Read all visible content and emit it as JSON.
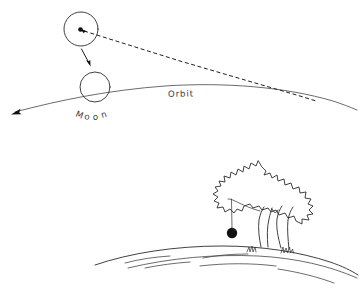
{
  "figure": {
    "background_color": "#ffffff",
    "ink_color": "#1a1a1a",
    "width": 361,
    "height": 295
  },
  "labels": {
    "orbit": "Orbit",
    "moon": "Moon",
    "moon_letters": [
      "M",
      "o",
      "o",
      "n"
    ]
  },
  "objects": {
    "upper_body": {
      "name": "moon-displaced-position",
      "center_x": 81,
      "center_y": 29,
      "radius": 17,
      "center_dot_radius": 2.2
    },
    "orbiting_body": {
      "name": "moon-on-orbit",
      "center_x": 95,
      "center_y": 87,
      "radius": 15
    },
    "apple": {
      "name": "falling-apple",
      "center_x": 232,
      "center_y": 233,
      "radius": 5.2,
      "string_top_y": 199
    }
  },
  "lines": {
    "orbit_arrow_tip": {
      "x": 13,
      "y": 113
    },
    "tangent_dashed": {
      "from_x": 86,
      "from_y": 31,
      "to_x": 320,
      "to_y": 104
    },
    "fall_arrow": {
      "from_x": 82,
      "from_y": 49,
      "to_x": 90,
      "to_y": 66
    }
  },
  "colors": {
    "ink": "#1a1a1a",
    "hairline": "#3a3a3a",
    "label": "#3c3c3c",
    "background": "#ffffff"
  }
}
